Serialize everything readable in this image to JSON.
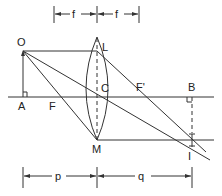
{
  "diagram": {
    "type": "thin-lens ray diagram",
    "labels": {
      "object_top": "O",
      "object_base": "A",
      "lens_top": "L",
      "lens_center": "C",
      "lens_bottom": "M",
      "focal_point_left": "F",
      "focal_point_right": "F'",
      "image_axis_point": "B",
      "image_tip": "I"
    },
    "dimensions": {
      "top_left": "f",
      "top_right": "f",
      "bottom_left": "p",
      "bottom_right": "q"
    }
  }
}
